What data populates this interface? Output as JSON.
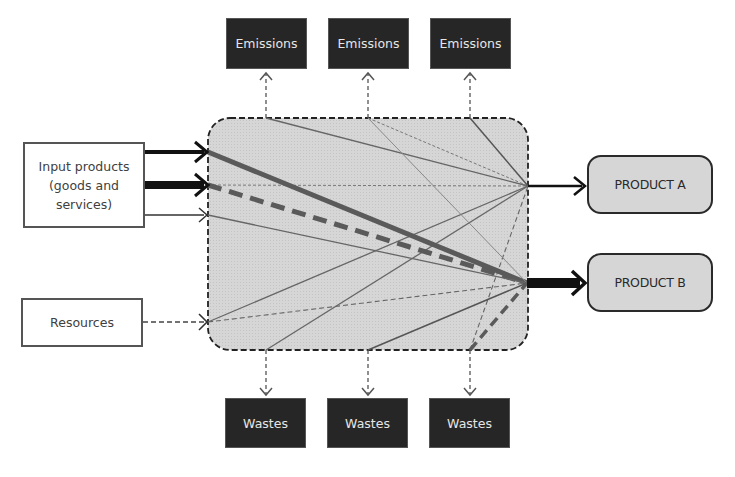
{
  "diagram": {
    "inputs": {
      "input_products": "Input products (goods and services)",
      "input_products_lines": [
        "Input products",
        "(goods and",
        "services)"
      ],
      "resources": "Resources"
    },
    "emissions": [
      {
        "label": "Emissions"
      },
      {
        "label": "Emissions"
      },
      {
        "label": "Emissions"
      }
    ],
    "wastes": [
      {
        "label": "Wastes"
      },
      {
        "label": "Wastes"
      },
      {
        "label": "Wastes"
      }
    ],
    "outputs": {
      "product_a": "PRODUCT A",
      "product_b": "PRODUCT B"
    },
    "process": {
      "fill": "#d4d4d4",
      "border": "dashed"
    },
    "colors": {
      "dark_box": "#262626",
      "dark_box_text": "#e6e6e6",
      "line_gray": "#5a5a5a",
      "arrow_black": "#111111"
    }
  }
}
